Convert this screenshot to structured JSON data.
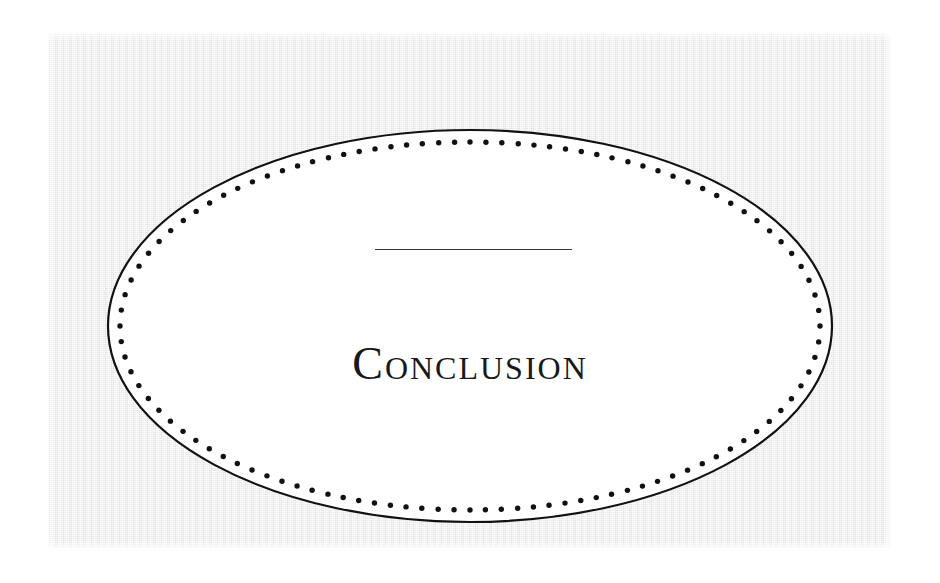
{
  "page": {
    "width": 940,
    "height": 583,
    "background_color": "#ffffff",
    "scan_color": "#e9e9e9",
    "ink_color": "#18181a"
  },
  "figure": {
    "name": "decorative-ellipse-frame",
    "outline_color": "#111111",
    "dot_color": "#111111",
    "fill_color": "#ffffff",
    "center_x": 470,
    "center_y": 326,
    "radius_x": 362,
    "radius_y": 196,
    "dot_count": 108,
    "dot_radius": 2.7,
    "dot_inset": 12
  },
  "chapter": {
    "rule": {
      "name": "chapter-rule",
      "color": "#3a3a3a",
      "x": 375,
      "y": 249,
      "width": 197,
      "thickness": 1.6
    },
    "title": "Conclusion"
  }
}
